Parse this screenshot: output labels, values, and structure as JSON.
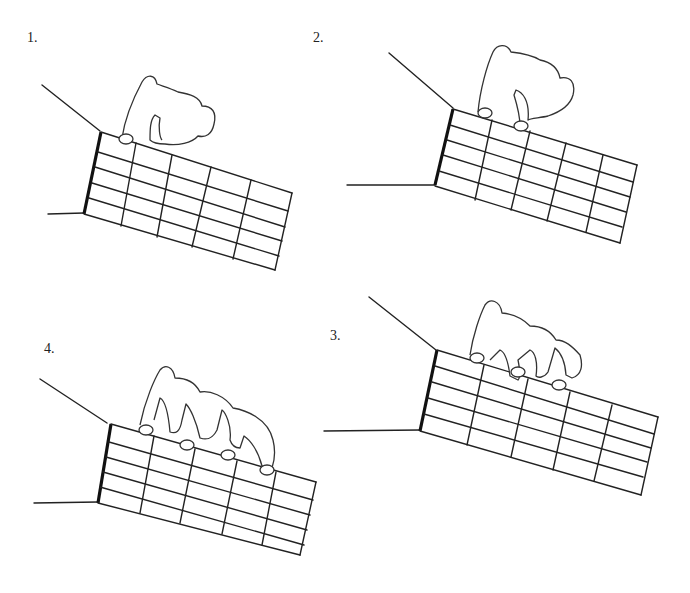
{
  "figures": [
    {
      "label": "1.",
      "x": 27,
      "y": 32,
      "fingers": 1
    },
    {
      "label": "2.",
      "x": 314,
      "y": 32,
      "fingers": 2
    },
    {
      "label": "4.",
      "x": 44,
      "y": 343,
      "fingers": 4
    },
    {
      "label": "3.",
      "x": 330,
      "y": 330,
      "fingers": 3
    }
  ]
}
